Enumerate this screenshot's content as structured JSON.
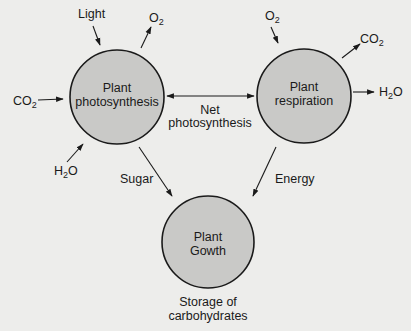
{
  "diagram": {
    "title": "",
    "colors": {
      "background": "#ededeb",
      "node_fill": "#c9c9c7",
      "stroke": "#1a1a1a",
      "text": "#1a1a1a"
    },
    "nodes": {
      "photosynthesis": {
        "line1": "Plant",
        "line2": "photosynthesis"
      },
      "respiration": {
        "line1": "Plant",
        "line2": "respiration"
      },
      "growth": {
        "line1": "Plant",
        "line2": "Gowth"
      }
    },
    "labels": {
      "light": "Light",
      "o2_out_photo": "O",
      "o2_out_photo_sub": "2",
      "co2_in_photo": "CO",
      "co2_in_photo_sub": "2",
      "h2o_in_photo_h": "H",
      "h2o_in_photo_sub": "2",
      "h2o_in_photo_o": "O",
      "o2_in_resp": "O",
      "o2_in_resp_sub": "2",
      "co2_out_resp": "CO",
      "co2_out_resp_sub": "2",
      "h2o_out_resp_h": "H",
      "h2o_out_resp_sub": "2",
      "h2o_out_resp_o": "O",
      "net_line1": "Net",
      "net_line2": "photosynthesis",
      "sugar": "Sugar",
      "energy": "Energy",
      "storage_line1": "Storage of",
      "storage_line2": "carbohydrates"
    },
    "edges": [
      {
        "from": "Light",
        "to": "Plant photosynthesis"
      },
      {
        "from": "Plant photosynthesis",
        "to": "O2"
      },
      {
        "from": "CO2",
        "to": "Plant photosynthesis"
      },
      {
        "from": "H2O",
        "to": "Plant photosynthesis"
      },
      {
        "from": "Plant photosynthesis",
        "to": "Plant respiration",
        "label": "Net photosynthesis",
        "bidirectional": true
      },
      {
        "from": "O2",
        "to": "Plant respiration"
      },
      {
        "from": "Plant respiration",
        "to": "CO2"
      },
      {
        "from": "Plant respiration",
        "to": "H2O"
      },
      {
        "from": "Plant photosynthesis",
        "to": "Plant Gowth",
        "label": "Sugar"
      },
      {
        "from": "Plant respiration",
        "to": "Plant Gowth",
        "label": "Energy"
      }
    ]
  }
}
